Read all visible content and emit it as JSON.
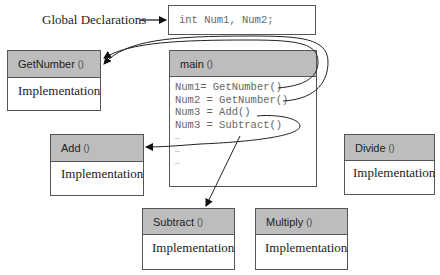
{
  "global_label": "Global Declarations",
  "global_box": {
    "code": "int Num1, Num2;"
  },
  "main": {
    "name": "main",
    "paren": "()",
    "lines": [
      "Num1= GetNumber()",
      "Num2 = GetNumber()",
      "Num3 = Add()",
      "Num3 = Subtract()",
      "…",
      "…",
      "…"
    ]
  },
  "functions": {
    "getnumber": {
      "name": "GetNumber",
      "paren": "()",
      "body": "Implementation"
    },
    "add": {
      "name": "Add",
      "paren": "()",
      "body": "Implementation"
    },
    "divide": {
      "name": "Divide",
      "paren": "()",
      "body": "Implementation"
    },
    "subtract": {
      "name": "Subtract",
      "paren": "()",
      "body": "Implementation"
    },
    "multiply": {
      "name": "Multiply",
      "paren": "()",
      "body": "Implementation"
    }
  },
  "colors": {
    "header_bg": "#bdbdbd",
    "border": "#555555",
    "code_text": "#666666"
  }
}
